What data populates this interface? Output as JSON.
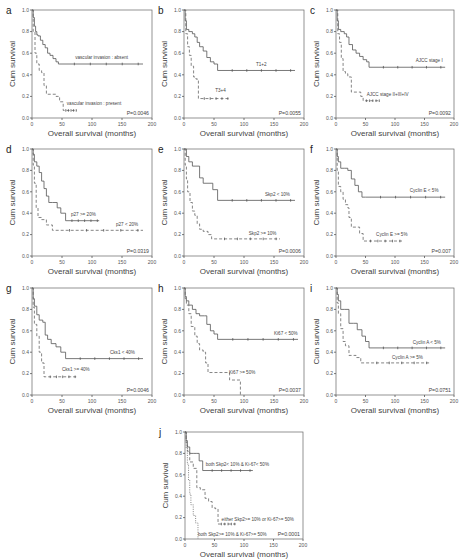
{
  "chart_data": [
    {
      "panel": "a",
      "type": "line",
      "subtype": "kaplan-meier",
      "xlabel": "Overall survival (months)",
      "ylabel": "Cum survival",
      "xlim": [
        0,
        200
      ],
      "ylim": [
        0.0,
        1.0
      ],
      "xticks": [
        0,
        50,
        100,
        150,
        200
      ],
      "yticks": [
        "0.0",
        "0.2",
        "0.4",
        "0.6",
        "0.8",
        "1.0"
      ],
      "p_value": "P=0.0046",
      "series": [
        {
          "name": "vascular invasion : absent",
          "style": "solid",
          "x": [
            0,
            2,
            4,
            6,
            8,
            10,
            14,
            18,
            22,
            26,
            30,
            35,
            40,
            44,
            185
          ],
          "y": [
            1.0,
            0.93,
            0.85,
            0.8,
            0.77,
            0.76,
            0.72,
            0.68,
            0.65,
            0.6,
            0.58,
            0.55,
            0.52,
            0.5,
            0.5
          ],
          "label_pos": [
            72,
            0.55
          ]
        },
        {
          "name": "vascular invasion : present",
          "style": "dashed",
          "x": [
            0,
            2,
            5,
            8,
            12,
            16,
            20,
            24,
            32,
            40,
            46,
            52,
            75
          ],
          "y": [
            1.0,
            0.8,
            0.6,
            0.5,
            0.44,
            0.42,
            0.3,
            0.22,
            0.22,
            0.2,
            0.15,
            0.07,
            0.07
          ],
          "label_pos": [
            58,
            0.12
          ]
        }
      ]
    },
    {
      "panel": "b",
      "type": "line",
      "subtype": "kaplan-meier",
      "xlabel": "Overall survival (months)",
      "ylabel": "Cum survival",
      "xlim": [
        0,
        200
      ],
      "ylim": [
        0.0,
        1.0
      ],
      "xticks": [
        0,
        50,
        100,
        150,
        200
      ],
      "yticks": [
        "0.0",
        "0.2",
        "0.4",
        "0.6",
        "0.8",
        "1.0"
      ],
      "p_value": "P=0.0055",
      "series": [
        {
          "name": "T1+2",
          "style": "solid",
          "x": [
            0,
            2,
            4,
            8,
            14,
            18,
            22,
            26,
            32,
            38,
            44,
            50,
            56,
            185
          ],
          "y": [
            1.0,
            0.9,
            0.82,
            0.8,
            0.78,
            0.75,
            0.7,
            0.66,
            0.62,
            0.56,
            0.52,
            0.5,
            0.44,
            0.44
          ],
          "label_pos": [
            120,
            0.48
          ]
        },
        {
          "name": "T3+4",
          "style": "dashed",
          "x": [
            0,
            3,
            6,
            9,
            12,
            16,
            20,
            24,
            76
          ],
          "y": [
            1.0,
            0.78,
            0.66,
            0.58,
            0.48,
            0.38,
            0.36,
            0.18,
            0.18
          ],
          "label_pos": [
            52,
            0.24
          ]
        }
      ]
    },
    {
      "panel": "c",
      "type": "line",
      "subtype": "kaplan-meier",
      "xlabel": "Overall survival (months)",
      "ylabel": "Cum survival",
      "xlim": [
        0,
        200
      ],
      "ylim": [
        0.0,
        1.0
      ],
      "xticks": [
        0,
        50,
        100,
        150,
        200
      ],
      "yticks": [
        "0.0",
        "0.2",
        "0.4",
        "0.6",
        "0.8",
        "1.0"
      ],
      "p_value": "P=0.0092",
      "series": [
        {
          "name": "AJCC stage I",
          "style": "solid",
          "x": [
            0,
            2,
            4,
            8,
            14,
            18,
            22,
            28,
            34,
            40,
            46,
            52,
            56,
            185
          ],
          "y": [
            1.0,
            0.9,
            0.82,
            0.8,
            0.78,
            0.75,
            0.68,
            0.63,
            0.6,
            0.57,
            0.54,
            0.52,
            0.47,
            0.47
          ],
          "label_pos": [
            135,
            0.52
          ]
        },
        {
          "name": "AJCC stage II+III+IV",
          "style": "dashed",
          "x": [
            0,
            3,
            6,
            9,
            12,
            16,
            20,
            26,
            34,
            42,
            46,
            75
          ],
          "y": [
            1.0,
            0.78,
            0.7,
            0.55,
            0.43,
            0.41,
            0.38,
            0.24,
            0.24,
            0.2,
            0.16,
            0.16
          ],
          "label_pos": [
            52,
            0.2
          ]
        }
      ]
    },
    {
      "panel": "d",
      "type": "line",
      "subtype": "kaplan-meier",
      "xlabel": "Overall survival (months)",
      "ylabel": "Cum survival",
      "xlim": [
        0,
        200
      ],
      "ylim": [
        0.0,
        1.0
      ],
      "xticks": [
        0,
        50,
        100,
        150,
        200
      ],
      "yticks": [
        "0.0",
        "0.2",
        "0.4",
        "0.6",
        "0.8",
        "1.0"
      ],
      "p_value": "P=0.0319",
      "series": [
        {
          "name": "p27 >= 20%",
          "style": "solid",
          "x": [
            0,
            2,
            4,
            8,
            12,
            16,
            20,
            24,
            28,
            34,
            42,
            48,
            56,
            112
          ],
          "y": [
            1.0,
            0.95,
            0.88,
            0.84,
            0.78,
            0.7,
            0.63,
            0.56,
            0.5,
            0.5,
            0.45,
            0.4,
            0.33,
            0.33
          ],
          "label_pos": [
            65,
            0.37
          ]
        },
        {
          "name": "p27 < 20%",
          "style": "dashed",
          "x": [
            0,
            2,
            4,
            7,
            10,
            16,
            24,
            34,
            185
          ],
          "y": [
            1.0,
            0.85,
            0.68,
            0.45,
            0.36,
            0.34,
            0.29,
            0.24,
            0.24
          ],
          "label_pos": [
            140,
            0.28
          ]
        }
      ]
    },
    {
      "panel": "e",
      "type": "line",
      "subtype": "kaplan-meier",
      "xlabel": "Overall survival (months)",
      "ylabel": "Cum survival",
      "xlim": [
        0,
        200
      ],
      "ylim": [
        0.0,
        1.0
      ],
      "xticks": [
        0,
        50,
        100,
        150,
        200
      ],
      "yticks": [
        "0.0",
        "0.2",
        "0.4",
        "0.6",
        "0.8",
        "1.0"
      ],
      "p_value": "P=0.0006",
      "series": [
        {
          "name": "Skp2 < 10%",
          "style": "solid",
          "x": [
            0,
            4,
            8,
            14,
            20,
            26,
            32,
            40,
            48,
            56,
            185
          ],
          "y": [
            1.0,
            0.93,
            0.88,
            0.84,
            0.84,
            0.73,
            0.68,
            0.68,
            0.62,
            0.52,
            0.52
          ],
          "label_pos": [
            135,
            0.56
          ]
        },
        {
          "name": "Skp2 >= 10%",
          "style": "dashed",
          "x": [
            0,
            2,
            4,
            6,
            10,
            14,
            18,
            22,
            26,
            32,
            40,
            46,
            160
          ],
          "y": [
            1.0,
            0.85,
            0.72,
            0.6,
            0.5,
            0.42,
            0.38,
            0.3,
            0.25,
            0.23,
            0.2,
            0.16,
            0.16
          ],
          "label_pos": [
            108,
            0.2
          ]
        }
      ]
    },
    {
      "panel": "f",
      "type": "line",
      "subtype": "kaplan-meier",
      "xlabel": "Overall survival (months)",
      "ylabel": "Cum survival",
      "xlim": [
        0,
        200
      ],
      "ylim": [
        0.0,
        1.0
      ],
      "xticks": [
        0,
        50,
        100,
        150,
        200
      ],
      "yticks": [
        "0.0",
        "0.2",
        "0.4",
        "0.6",
        "0.8",
        "1.0"
      ],
      "p_value": "P=0.007",
      "series": [
        {
          "name": "Cyclin E < 5%",
          "style": "solid",
          "x": [
            0,
            2,
            4,
            8,
            14,
            20,
            26,
            32,
            38,
            44,
            50,
            185
          ],
          "y": [
            1.0,
            0.93,
            0.88,
            0.82,
            0.82,
            0.8,
            0.72,
            0.66,
            0.6,
            0.55,
            0.55,
            0.55
          ],
          "label_pos": [
            125,
            0.6
          ]
        },
        {
          "name": "Cyclin E >= 5%",
          "style": "dashed",
          "x": [
            0,
            2,
            4,
            8,
            12,
            16,
            20,
            22,
            26,
            34,
            40,
            46,
            112
          ],
          "y": [
            1.0,
            0.8,
            0.65,
            0.6,
            0.53,
            0.48,
            0.45,
            0.36,
            0.27,
            0.27,
            0.21,
            0.14,
            0.14
          ],
          "label_pos": [
            68,
            0.19
          ]
        }
      ]
    },
    {
      "panel": "g",
      "type": "line",
      "subtype": "kaplan-meier",
      "xlabel": "Overall survival (months)",
      "ylabel": "Cum survival",
      "xlim": [
        0,
        200
      ],
      "ylim": [
        0.0,
        1.0
      ],
      "xticks": [
        0,
        50,
        100,
        150,
        200
      ],
      "yticks": [
        "0.0",
        "0.2",
        "0.4",
        "0.6",
        "0.8",
        "1.0"
      ],
      "p_value": "P=0.0046",
      "series": [
        {
          "name": "Cks1 < 40%",
          "style": "solid",
          "x": [
            0,
            2,
            4,
            8,
            12,
            18,
            22,
            26,
            32,
            40,
            48,
            56,
            185
          ],
          "y": [
            1.0,
            0.9,
            0.83,
            0.75,
            0.7,
            0.68,
            0.56,
            0.52,
            0.48,
            0.45,
            0.4,
            0.34,
            0.34
          ],
          "label_pos": [
            130,
            0.38
          ]
        },
        {
          "name": "Cks1 >= 40%",
          "style": "dashed",
          "x": [
            0,
            2,
            4,
            8,
            12,
            16,
            20,
            75
          ],
          "y": [
            1.0,
            0.82,
            0.66,
            0.55,
            0.4,
            0.3,
            0.17,
            0.17
          ],
          "label_pos": [
            50,
            0.22
          ]
        }
      ]
    },
    {
      "panel": "h",
      "type": "line",
      "subtype": "kaplan-meier",
      "xlabel": "Overall survival (months)",
      "ylabel": "Cum survival",
      "xlim": [
        0,
        200
      ],
      "ylim": [
        0.0,
        1.0
      ],
      "xticks": [
        0,
        50,
        100,
        150,
        200
      ],
      "yticks": [
        "0.0",
        "0.2",
        "0.4",
        "0.6",
        "0.8",
        "1.0"
      ],
      "p_value": "P=0.0037",
      "series": [
        {
          "name": "Ki67 < 50%",
          "style": "solid",
          "x": [
            0,
            2,
            4,
            8,
            14,
            20,
            26,
            34,
            38,
            44,
            50,
            56,
            190
          ],
          "y": [
            1.0,
            0.92,
            0.88,
            0.84,
            0.8,
            0.76,
            0.74,
            0.74,
            0.66,
            0.6,
            0.57,
            0.52,
            0.52
          ],
          "label_pos": [
            150,
            0.56
          ]
        },
        {
          "name": "Ki67 >= 50%",
          "style": "dashed",
          "x": [
            0,
            2,
            4,
            8,
            12,
            18,
            22,
            26,
            32,
            36,
            40,
            70,
            76,
            86,
            94
          ],
          "y": [
            1.0,
            0.9,
            0.84,
            0.76,
            0.64,
            0.55,
            0.48,
            0.42,
            0.4,
            0.3,
            0.21,
            0.21,
            0.14,
            0.14,
            0.0
          ],
          "label_pos": [
            75,
            0.2
          ]
        }
      ]
    },
    {
      "panel": "i",
      "type": "line",
      "subtype": "kaplan-meier",
      "xlabel": "Overall survival (months)",
      "ylabel": "Cum survival",
      "xlim": [
        0,
        200
      ],
      "ylim": [
        0.0,
        1.0
      ],
      "xticks": [
        0,
        50,
        100,
        150,
        200
      ],
      "yticks": [
        "0.0",
        "0.2",
        "0.4",
        "0.6",
        "0.8",
        "1.0"
      ],
      "p_value": "P=0.0751",
      "series": [
        {
          "name": "Cyclin A < 5%",
          "style": "solid",
          "x": [
            0,
            2,
            4,
            8,
            14,
            22,
            30,
            36,
            44,
            50,
            56,
            185
          ],
          "y": [
            1.0,
            0.94,
            0.88,
            0.8,
            0.8,
            0.67,
            0.67,
            0.61,
            0.55,
            0.5,
            0.44,
            0.44
          ],
          "label_pos": [
            130,
            0.48
          ]
        },
        {
          "name": "Cyclin A >= 5%",
          "style": "dashed",
          "x": [
            0,
            2,
            4,
            8,
            12,
            16,
            22,
            34,
            42,
            48,
            160
          ],
          "y": [
            1.0,
            0.86,
            0.76,
            0.62,
            0.5,
            0.46,
            0.37,
            0.35,
            0.3,
            0.3,
            0.3
          ],
          "label_pos": [
            95,
            0.34
          ]
        }
      ]
    },
    {
      "panel": "j",
      "type": "line",
      "subtype": "kaplan-meier",
      "xlabel": "Overall survival (months)",
      "ylabel": "Cum survival",
      "xlim": [
        0,
        200
      ],
      "ylim": [
        0.0,
        1.0
      ],
      "xticks": [
        0,
        50,
        100,
        150,
        200
      ],
      "yticks": [
        "0.0",
        "0.2",
        "0.4",
        "0.6",
        "0.8",
        "1.0"
      ],
      "p_value": "P=0.0001",
      "series": [
        {
          "name": "both Skp2< 10% & Ki-67< 50%",
          "style": "solid",
          "x": [
            0,
            2,
            4,
            8,
            14,
            20,
            24,
            30,
            115
          ],
          "y": [
            1.0,
            0.92,
            0.86,
            0.8,
            0.8,
            0.8,
            0.73,
            0.64,
            0.64
          ],
          "label_pos": [
            35,
            0.68
          ]
        },
        {
          "name": "either Skp2>= 10% or Ki-67>= 50%",
          "style": "dashed",
          "x": [
            0,
            2,
            4,
            8,
            14,
            20,
            26,
            34,
            40,
            46,
            52,
            56,
            86
          ],
          "y": [
            1.0,
            0.9,
            0.82,
            0.72,
            0.66,
            0.48,
            0.46,
            0.38,
            0.35,
            0.29,
            0.28,
            0.14,
            0.14
          ],
          "label_pos": [
            62,
            0.17
          ]
        },
        {
          "name": "both Skp2>= 10% & Ki-67>= 50%",
          "style": "dotted",
          "x": [
            0,
            2,
            4,
            6,
            8,
            10,
            14,
            18,
            22
          ],
          "y": [
            1.0,
            0.85,
            0.7,
            0.55,
            0.42,
            0.32,
            0.22,
            0.15,
            0.0
          ],
          "label_pos": [
            22,
            0.03
          ]
        }
      ]
    }
  ]
}
